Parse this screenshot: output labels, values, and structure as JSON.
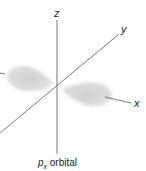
{
  "diagram": {
    "caption": {
      "symbol": "p",
      "subscript": "x",
      "text": " orbital"
    },
    "axes": {
      "z": {
        "label": "z"
      },
      "y": {
        "label": "y"
      },
      "x": {
        "label": "x"
      }
    },
    "colors": {
      "axis": "#555555",
      "lobe": "#d4d4d4",
      "text": "#222222",
      "background": "#ffffff"
    }
  }
}
